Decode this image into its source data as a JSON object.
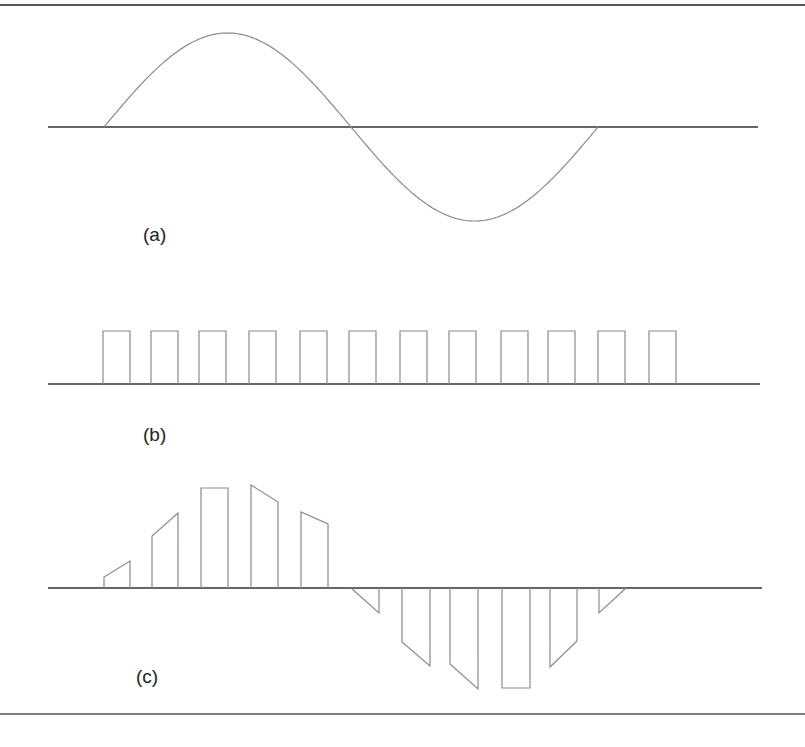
{
  "figure": {
    "border_top_y": 5,
    "border_bottom_y": 714,
    "colors": {
      "border": "#555555",
      "axis": "#333333",
      "waveform": "#8a8a8a",
      "text": "#222222"
    }
  },
  "panels": [
    {
      "id": "a",
      "label": "(a)",
      "description": "Analog sine wave signal",
      "axis": {
        "x1": 48,
        "x2": 758,
        "y": 127
      },
      "sine": {
        "x_start": 104,
        "x_end": 598,
        "amplitude": 94,
        "periods": 1
      },
      "label_pos": {
        "x": 143,
        "y": 224
      }
    },
    {
      "id": "b",
      "label": "(b)",
      "description": "Sampling pulse train (12 rectangular pulses)",
      "axis": {
        "x1": 48,
        "x2": 760,
        "y": 384
      },
      "pulse_height": 53,
      "pulse_width": 27,
      "pulse_starts": [
        103,
        151,
        199,
        249,
        300,
        349,
        400,
        449,
        501,
        548,
        598,
        649
      ],
      "label_pos": {
        "x": 143,
        "y": 424
      }
    },
    {
      "id": "c",
      "label": "(c)",
      "description": "PAM (natural sampling) output: pulses with tops following the sine",
      "axis": {
        "x1": 48,
        "x2": 762,
        "y": 588
      },
      "pulses": [
        {
          "x1": 104,
          "x2": 130,
          "y_left": 577,
          "y_right": 561
        },
        {
          "x1": 152,
          "x2": 178,
          "y_left": 536,
          "y_right": 513
        },
        {
          "x1": 201,
          "x2": 228,
          "y_left": 488,
          "y_right": 488
        },
        {
          "x1": 251,
          "x2": 278,
          "y_left": 485,
          "y_right": 502
        },
        {
          "x1": 301,
          "x2": 328,
          "y_left": 512,
          "y_right": 524
        },
        {
          "x1": 351,
          "x2": 379,
          "y_left": 588,
          "y_right": 613
        },
        {
          "x1": 402,
          "x2": 430,
          "y_left": 642,
          "y_right": 666
        },
        {
          "x1": 450,
          "x2": 478,
          "y_left": 664,
          "y_right": 689
        },
        {
          "x1": 502,
          "x2": 530,
          "y_left": 688,
          "y_right": 688
        },
        {
          "x1": 550,
          "x2": 577,
          "y_left": 667,
          "y_right": 641
        },
        {
          "x1": 599,
          "x2": 626,
          "y_left": 613,
          "y_right": 588
        }
      ],
      "label_pos": {
        "x": 136,
        "y": 666
      }
    }
  ]
}
